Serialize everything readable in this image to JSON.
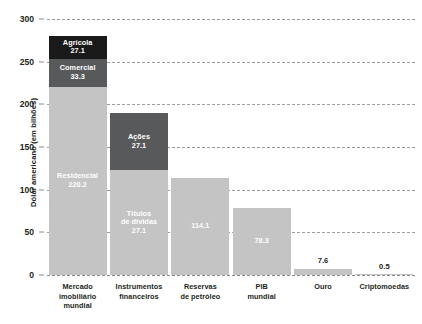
{
  "chart_data": {
    "type": "bar",
    "title": "",
    "subtitle": "",
    "xlabel": "",
    "ylabel": "Dólar americano (em bilhões)",
    "ylim": [
      0,
      300
    ],
    "yticks": [
      0,
      50,
      100,
      150,
      200,
      250,
      300
    ],
    "grid": true,
    "stacked": true,
    "legend": "none",
    "categories": [
      "Mercado imobiliário mundial",
      "Instrumentos financeiros",
      "Reservas de petróleo",
      "PIB mundial",
      "Ouro",
      "Criptomoedas"
    ],
    "category_lines": [
      [
        "Mercado",
        "imobiliário",
        "mundial"
      ],
      [
        "Instrumentos",
        "financeiros"
      ],
      [
        "Reservas",
        "de petróleo"
      ],
      [
        "PIB",
        "mundial"
      ],
      [
        "Ouro"
      ],
      [
        "Criptomoedas"
      ]
    ],
    "bars": [
      {
        "category": "Mercado imobiliário mundial",
        "segments": [
          {
            "label": "Residencial",
            "value": "220.2",
            "height": 220.2,
            "tone": "light",
            "label_inside": true
          },
          {
            "label": "Comercial",
            "value": "33.3",
            "height": 33.3,
            "tone": "mid",
            "label_inside": true
          },
          {
            "label": "Agrícola",
            "value": "27.1",
            "height": 27.1,
            "tone": "dark",
            "label_inside": true
          }
        ]
      },
      {
        "category": "Instrumentos financeiros",
        "segments": [
          {
            "label": "Títulos\nde dívidas",
            "value": "27.1",
            "height": 122.5,
            "tone": "light",
            "label_inside": true
          },
          {
            "label": "Ações",
            "value": "27.1",
            "height": 67.5,
            "tone": "mid",
            "label_inside": true
          }
        ]
      },
      {
        "category": "Reservas de petróleo",
        "segments": [
          {
            "label": "",
            "value": "114.1",
            "height": 114.1,
            "tone": "light",
            "label_inside": true
          }
        ]
      },
      {
        "category": "PIB mundial",
        "segments": [
          {
            "label": "",
            "value": "78.3",
            "height": 78.3,
            "tone": "light",
            "label_inside": true
          }
        ]
      },
      {
        "category": "Ouro",
        "segments": [
          {
            "label": "",
            "value": "7.6",
            "height": 7.6,
            "tone": "light",
            "label_inside": false
          }
        ]
      },
      {
        "category": "Criptomoedas",
        "segments": [
          {
            "label": "",
            "value": "0.5",
            "height": 0.5,
            "tone": "light",
            "label_inside": false
          }
        ]
      }
    ],
    "colors": {
      "light": "#c4c4c4",
      "mid": "#58595b",
      "dark": "#1a1a1a",
      "text": "#231f20",
      "grid": "#9b9b9b",
      "background": "#ffffff"
    }
  }
}
